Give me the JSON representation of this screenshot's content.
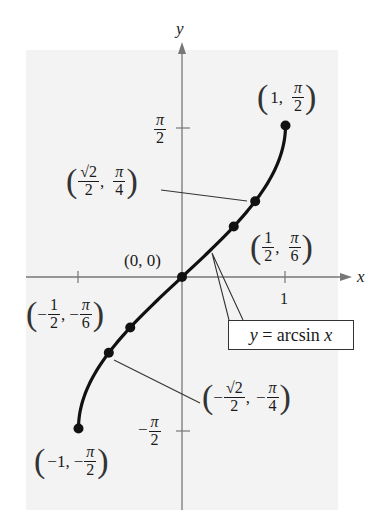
{
  "chart_data": {
    "type": "line",
    "title": "",
    "function": "y = arcsin x",
    "xlabel": "x",
    "ylabel": "y",
    "xlim": [
      -1,
      1
    ],
    "ylim": [
      -1.5708,
      1.5708
    ],
    "grid": false,
    "x_ticks": [
      {
        "value": -1,
        "label": ""
      },
      {
        "value": 1,
        "label": "1"
      }
    ],
    "y_ticks": [
      {
        "value": 1.5708,
        "label": "π/2"
      },
      {
        "value": -1.5708,
        "label": "-π/2"
      }
    ],
    "series": [
      {
        "name": "y = arcsin x",
        "x": [
          -1,
          -0.7071,
          -0.5,
          0,
          0.5,
          0.7071,
          1
        ],
        "y": [
          -1.5708,
          -0.7854,
          -0.5236,
          0,
          0.5236,
          0.7854,
          1.5708
        ]
      }
    ],
    "annotations": [
      {
        "point": [
          1,
          1.5708
        ],
        "label": "(1, π/2)"
      },
      {
        "point": [
          0.7071,
          0.7854
        ],
        "label": "(√2/2, π/4)"
      },
      {
        "point": [
          0.5,
          0.5236
        ],
        "label": "(1/2, π/6)"
      },
      {
        "point": [
          0,
          0
        ],
        "label": "(0, 0)"
      },
      {
        "point": [
          -0.5,
          -0.5236
        ],
        "label": "(-1/2, -π/6)"
      },
      {
        "point": [
          -0.7071,
          -0.7854
        ],
        "label": "(-√2/2, -π/4)"
      },
      {
        "point": [
          -1,
          -1.5708
        ],
        "label": "(-1, -π/2)"
      }
    ],
    "legend": {
      "text": "y = arcsin x",
      "position": "callout box below curve, right of y-axis"
    }
  },
  "axes": {
    "x_label": "x",
    "y_label": "y",
    "x_tick_one": "1",
    "pi": "π",
    "two": "2",
    "minus": "−"
  },
  "labels": {
    "p1": {
      "open": "(",
      "a": "1,",
      "num": "π",
      "den": "2",
      "close": ")"
    },
    "p2": {
      "open": "(",
      "num1": "√2",
      "den1": "2",
      "comma": ",",
      "num2": "π",
      "den2": "4",
      "close": ")"
    },
    "p3": {
      "open": "(",
      "num1": "1",
      "den1": "2",
      "comma": ",",
      "num2": "π",
      "den2": "6",
      "close": ")"
    },
    "origin": "(0, 0)",
    "p5": {
      "open": "(",
      "num1": "1",
      "den1": "2",
      "comma": ",",
      "num2": "π",
      "den2": "6",
      "close": ")",
      "minus": "−"
    },
    "p6": {
      "open": "(",
      "num1": "√2",
      "den1": "2",
      "comma": ",",
      "num2": "π",
      "den2": "4",
      "close": ")",
      "minus": "−"
    },
    "p7": {
      "open": "(",
      "a": "−1,",
      "minus": "−",
      "num": "π",
      "den": "2",
      "close": ")"
    }
  },
  "callout": {
    "y": "y",
    "eq": " = arcsin ",
    "x": "x"
  },
  "colors": {
    "background": "#ffffff",
    "panel": "#f3f3f3",
    "curve": "#111111",
    "axis": "#777777"
  }
}
